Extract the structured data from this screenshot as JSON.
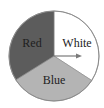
{
  "diagram": {
    "type": "spinner",
    "center": [
      54,
      56
    ],
    "radius": 45,
    "sections": [
      {
        "label": "White",
        "color": "#ffffff",
        "text_color": "#222222",
        "start_deg": -90,
        "end_deg": 33,
        "label_pos": [
          77,
          47
        ]
      },
      {
        "label": "Blue",
        "color": "#b4b4b4",
        "text_color": "#222222",
        "start_deg": 33,
        "end_deg": 148,
        "label_pos": [
          54,
          84
        ]
      },
      {
        "label": "Red",
        "color": "#5c5c5c",
        "text_color": "#1e1e1e",
        "start_deg": 148,
        "end_deg": 270,
        "label_pos": [
          32,
          47
        ]
      }
    ],
    "pointer": {
      "from": [
        54,
        56
      ],
      "to": [
        82,
        56
      ],
      "color": "#7a7a7a"
    },
    "outline_color": "#8a8a8a"
  }
}
